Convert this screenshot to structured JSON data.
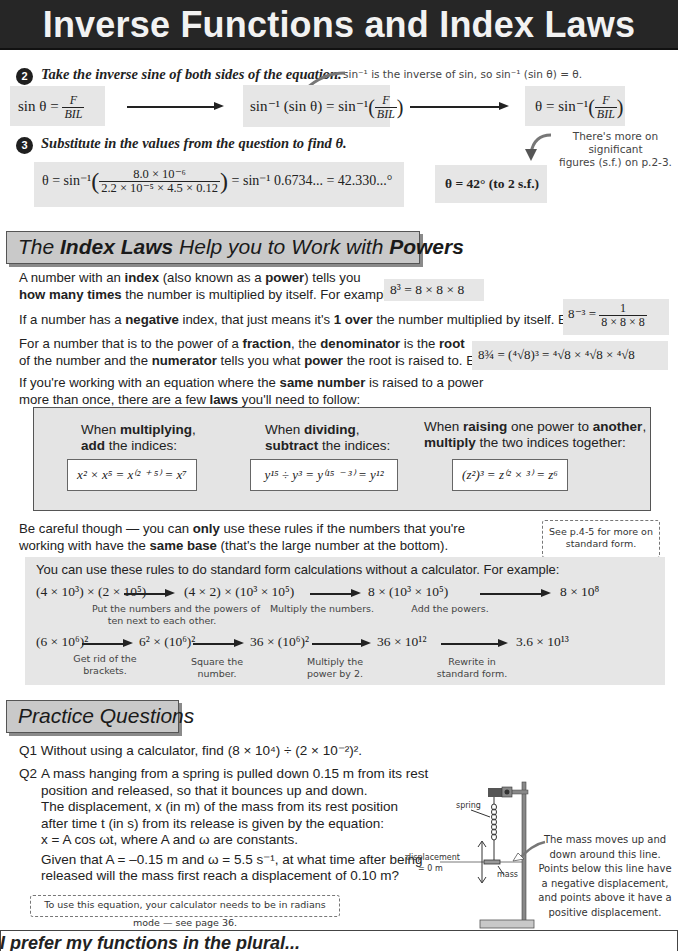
{
  "header": {
    "title": "Inverse Functions and Index Laws"
  },
  "step2": {
    "number": "2",
    "instruction": "Take the inverse sine of both sides of the equation.",
    "note": "sin⁻¹ is the inverse of sin, so sin⁻¹ (sin θ) = θ.",
    "eq1_left": "sin θ = ",
    "eq1_num": "F",
    "eq1_den": "BIL",
    "eq2_left": "sin⁻¹ (sin θ) = sin⁻¹",
    "eq2_num": "F",
    "eq2_den": "BIL",
    "eq3_left": "θ = sin⁻¹",
    "eq3_num": "F",
    "eq3_den": "BIL"
  },
  "step3": {
    "number": "3",
    "instruction": "Substitute in the values from the question to find θ.",
    "eq_left": "θ = sin⁻¹",
    "eq_num": "8.0 × 10⁻⁶",
    "eq_den": "2.2 × 10⁻⁵ × 4.5 × 0.12",
    "eq_right": "= sin⁻¹ 0.6734... = 42.330...°",
    "answer": "θ = 42° (to 2 s.f.)",
    "note_line1": "There's more on significant",
    "note_line2": "figures (s.f.) on p.2-3."
  },
  "index_laws": {
    "heading_pre": "The ",
    "heading_b1": "Index Laws",
    "heading_mid": " Help you to Work with ",
    "heading_b2": "Powers",
    "p1_l1_a": "A number with an ",
    "p1_l1_b": "index",
    "p1_l1_c": " (also known as a ",
    "p1_l1_d": "power",
    "p1_l1_e": ") tells you",
    "p1_l2_a": "how many times",
    "p1_l2_b": " the number is multiplied by itself.  For example:",
    "ex1": "8³ = 8 × 8 × 8",
    "p2_a": "If a number has a ",
    "p2_b": "negative",
    "p2_c": " index, that just means it's ",
    "p2_d": "1 over",
    "p2_e": " the number multiplied by itself.  E.g.",
    "ex2_left": "8⁻³ = ",
    "ex2_num": "1",
    "ex2_den": "8 × 8 × 8",
    "p3_l1_a": "For a number that is to the power of a ",
    "p3_l1_b": "fraction",
    "p3_l1_c": ", the ",
    "p3_l1_d": "denominator",
    "p3_l1_e": " is the ",
    "p3_l1_f": "root",
    "p3_l2_a": "of the number and the ",
    "p3_l2_b": "numerator",
    "p3_l2_c": " tells you what ",
    "p3_l2_d": "power",
    "p3_l2_e": " the root is raised to.  E.g.",
    "ex3": "8¾ = (⁴√8)³ = ⁴√8 × ⁴√8 × ⁴√8",
    "p4_l1_a": "If you're working with an equation where the ",
    "p4_l1_b": "same number",
    "p4_l1_c": " is raised to a power",
    "p4_l2_a": "more than once, there are a few ",
    "p4_l2_b": "laws",
    "p4_l2_c": " you'll need to follow:",
    "laws": [
      {
        "l1_a": "When ",
        "l1_b": "multiplying",
        "l1_c": ",",
        "l2_a": "add",
        "l2_b": " the indices:",
        "formula": "x² × x⁵ = x⁽² ⁺ ⁵⁾ = x⁷"
      },
      {
        "l1_a": "When ",
        "l1_b": "dividing",
        "l1_c": ",",
        "l2_a": "subtract",
        "l2_b": " the indices:",
        "formula": "y¹⁵ ÷ y³ = y⁽¹⁵ ⁻ ³⁾ = y¹²"
      },
      {
        "l1_a": "When ",
        "l1_b": "raising",
        "l1_c": " one power to ",
        "l1_d": "another",
        "l1_e": ",",
        "l2_a": "multiply",
        "l2_b": " the two indices together:",
        "formula": "(z²)³ = z⁽² × ³⁾ = z⁶"
      }
    ],
    "p5_l1_a": "Be careful though — you can ",
    "p5_l1_b": "only",
    "p5_l1_c": " use these rules if the numbers that you're",
    "p5_l2_a": "working with have the ",
    "p5_l2_b": "same base",
    "p5_l2_c": " (that's the large number at the bottom).",
    "tip_line1": "See p.4-5 for more on",
    "tip_line2": "standard form."
  },
  "standard_form": {
    "intro": "You can use these rules to do standard form calculations without a calculator.  For example:",
    "row1": [
      "(4 × 10³) × (2 × 10⁵)",
      "(4 × 2) × (10³ × 10⁵)",
      "8 × (10³ × 10⁵)",
      "8 × 10⁸"
    ],
    "row1_notes": [
      "Put the numbers and the powers of",
      "ten next to each other.",
      "Multiply the numbers.",
      "Add the powers."
    ],
    "row2": [
      "(6 × 10⁶)²",
      "6² × (10⁶)²",
      "36 × (10⁶)²",
      "36 × 10¹²",
      "3.6 × 10¹³"
    ],
    "row2_notes": [
      [
        "Get rid of the",
        "brackets."
      ],
      [
        "Square the",
        "number."
      ],
      [
        "Multiply the",
        "power by 2."
      ],
      [
        "Rewrite in",
        "standard form."
      ]
    ]
  },
  "practice": {
    "heading": "Practice Questions",
    "q1_label": "Q1",
    "q1_text": "Without using a calculator, find (8 × 10⁴) ÷ (2 × 10⁻²)².",
    "q2_label": "Q2",
    "q2_lines": [
      "A mass hanging from a spring is pulled down 0.15 m from its rest",
      "position and released, so that it bounces up and down.",
      "The displacement, x (in m) of the mass from its rest position",
      "after time t (in s) from its release is given by the equation:",
      "x = A cos ωt, where A and ω are constants.",
      "Given that A = –0.15 m and ω = 5.5 s⁻¹, at what time after being",
      "released will the mass first reach a displacement of 0.10 m?"
    ],
    "tip": "To use this equation, your calculator needs to be in radians mode — see page 36."
  },
  "diagram": {
    "spring_label": "spring",
    "mass_label": "mass",
    "displacement_label": "displacement",
    "displacement_value": "= 0 m",
    "note_lines": [
      "The mass moves up and",
      "down around this line.",
      "Points below this line have",
      "a negative displacement,",
      "and points above it have a",
      "positive displacement."
    ]
  },
  "footer": {
    "text": "I prefer my functions in the plural..."
  }
}
